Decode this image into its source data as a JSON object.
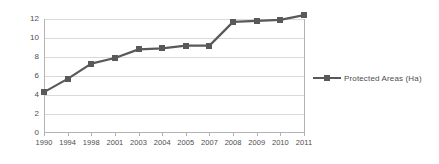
{
  "chart_data": {
    "type": "line",
    "title": "",
    "subtitle": "",
    "xlabel": "",
    "ylabel": "",
    "categories": [
      "1990",
      "1994",
      "1998",
      "2001",
      "2003",
      "2004",
      "2005",
      "2007",
      "2008",
      "2009",
      "2010",
      "2011"
    ],
    "series": [
      {
        "name": "Protected Areas (Ha)",
        "values": [
          4.3,
          5.7,
          7.3,
          7.9,
          8.8,
          8.9,
          9.2,
          9.2,
          11.7,
          11.8,
          11.9,
          12.4
        ],
        "color": "#595959",
        "marker": "square"
      }
    ],
    "ylim": [
      0,
      12
    ],
    "yticks": [
      0,
      2,
      4,
      6,
      8,
      10,
      12
    ],
    "ytick_labels": [
      "0",
      "2",
      "4",
      "6",
      "8",
      "10",
      "12"
    ],
    "xtick_labels": [
      "1990",
      "1994",
      "1998",
      "2001",
      "2003",
      "2004",
      "2005",
      "2007",
      "2008",
      "2009",
      "2010",
      "2011"
    ],
    "grid": {
      "horizontal": true,
      "vertical": false,
      "color": "#d9d9d9"
    },
    "legend": {
      "position": "right",
      "entries": [
        {
          "label": "Protected Areas (Ha)",
          "color": "#595959"
        }
      ]
    },
    "axis": {
      "line_color": "#b3b3b3",
      "tick_label_color": "#4d4d4d"
    },
    "background": "#ffffff"
  }
}
